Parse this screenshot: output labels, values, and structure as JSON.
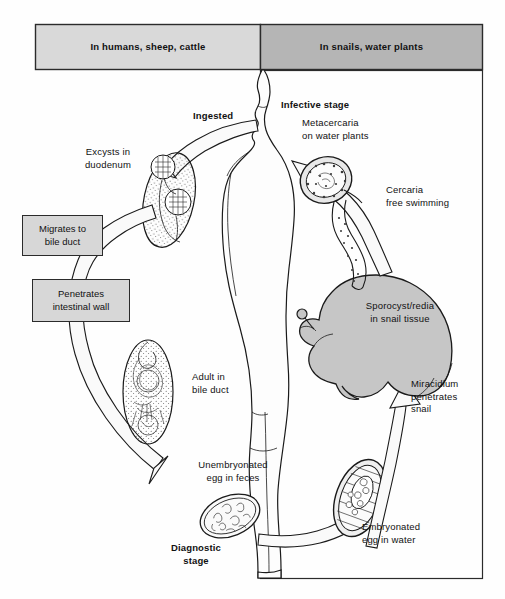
{
  "figure": {
    "type": "life-cycle-diagram",
    "background_color": "#fefefe",
    "line_color": "#1a1a1a"
  },
  "header": {
    "left_panel": {
      "label": "In humans, sheep, cattle",
      "fill": "#d9d9d9"
    },
    "right_panel": {
      "label": "In snails, water plants",
      "fill": "#b5b5b5"
    }
  },
  "stage_labels": [
    {
      "id": "ingested",
      "text": "Ingested",
      "bold": true
    },
    {
      "id": "infective-stage",
      "text": "Infective stage",
      "bold": true
    },
    {
      "id": "diagnostic-stage",
      "text": "Diagnostic\nstage",
      "bold": true
    }
  ],
  "annotations": {
    "excysts": {
      "line1": "Excysts in",
      "line2": "duodenum"
    },
    "adult": {
      "line1": "Adult in",
      "line2": "bile duct"
    },
    "unembryonated": {
      "line1": "Unembryonated",
      "line2": "egg in feces"
    },
    "metacercaria": {
      "line1": "Metacercaria",
      "line2": "on water plants"
    },
    "cercaria": {
      "line1": "Cercaria",
      "line2": "free swimming"
    },
    "sporocyst": {
      "line1": "Sporocyst/redia",
      "line2": "in snail tissue"
    },
    "miracidium": {
      "line1": "Miracidium",
      "line2": "penetrates",
      "line3": "snail"
    },
    "embryonated": {
      "line1": "Embryonated",
      "line2": "egg in water"
    }
  },
  "callout_boxes": [
    {
      "id": "migrates-to-bile-duct",
      "line1": "Migrates to",
      "line2": "bile duct",
      "fill": "#d7d7d7"
    },
    {
      "id": "penetrates-intestinal-wall",
      "line1": "Penetrates",
      "line2": "intestinal wall",
      "fill": "#d7d7d7"
    }
  ],
  "organisms": [
    {
      "id": "metacercaria-cyst",
      "caption_ref": "metacercaria"
    },
    {
      "id": "cercaria",
      "caption_ref": "cercaria"
    },
    {
      "id": "snail",
      "caption_ref": "sporocyst",
      "fill": "#c6c6c6"
    },
    {
      "id": "embryonated-egg",
      "caption_ref": "embryonated"
    },
    {
      "id": "unembryonated-egg",
      "caption_ref": "unembryonated"
    },
    {
      "id": "adult-fluke",
      "caption_ref": "adult"
    },
    {
      "id": "excysting-fluke",
      "caption_ref": "excysts"
    }
  ],
  "arrows": [
    {
      "id": "ingestion-arrow",
      "from": "metacercaria-cyst",
      "to": "mouth",
      "direction": "up-right"
    },
    {
      "id": "excyst-arrow",
      "from": "mouth",
      "to": "duodenum",
      "direction": "down-left"
    },
    {
      "id": "bile-duct-arrow",
      "from": "duodenum",
      "to": "feces",
      "direction": "down-right"
    },
    {
      "id": "egg-to-water-arrow",
      "from": "feces",
      "to": "embryonated-egg",
      "direction": "right"
    },
    {
      "id": "miracidium-arrow",
      "from": "embryonated-egg",
      "to": "snail",
      "direction": "up"
    },
    {
      "id": "cercaria-arrow",
      "from": "snail",
      "to": "metacercaria-cyst",
      "direction": "up-left"
    }
  ]
}
